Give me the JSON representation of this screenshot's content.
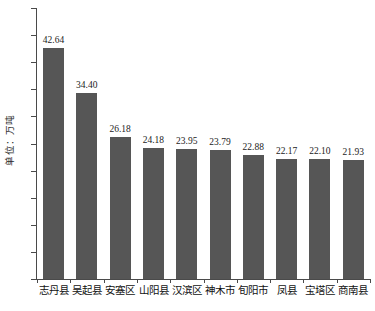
{
  "chart_data": {
    "type": "bar",
    "title": "",
    "subtitle": "",
    "xlabel": "",
    "ylabel": "单位：万吨",
    "ylim": [
      0,
      50
    ],
    "yticks": [
      0,
      5,
      10,
      15,
      20,
      25,
      30,
      35,
      40,
      45,
      50
    ],
    "ytick_labels": [
      "0",
      "5",
      "10",
      "15",
      "20",
      "25",
      "30",
      "35",
      "40",
      "45",
      "50"
    ],
    "grid": false,
    "legend": false,
    "legend_position": "none",
    "bar_color": "#565656",
    "axis_color": "#4a4a4a",
    "background": "#ffffff",
    "categories": [
      "志丹县",
      "吴起县",
      "安塞区",
      "山阳县",
      "汉滨区",
      "神木市",
      "旬阳市",
      "凤县",
      "宝塔区",
      "商南县"
    ],
    "values": [
      42.64,
      34.4,
      26.18,
      24.18,
      23.95,
      23.79,
      22.88,
      22.17,
      22.1,
      21.93
    ],
    "value_labels": [
      "42.64",
      "34.40",
      "26.18",
      "24.18",
      "23.95",
      "23.79",
      "22.88",
      "22.17",
      "22.10",
      "21.93"
    ]
  }
}
